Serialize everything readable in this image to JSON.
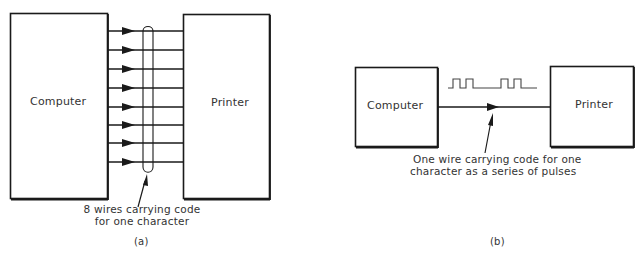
{
  "panel_a": {
    "computer_label": "Computer",
    "printer_label": "Printer",
    "wire_count": 8,
    "caption_line1": "8 wires carrying code",
    "caption_line2": "for one character",
    "panel_label": "(a)"
  },
  "panel_b": {
    "computer_label": "Computer",
    "printer_label": "Printer",
    "wire_count": 1,
    "pulse_pattern": "0101100110",
    "caption_line1": "One wire carrying code for one",
    "caption_line2": "character as a series of pulses",
    "panel_label": "(b)"
  },
  "colors": {
    "line": "#1a1a1a",
    "text": "#333333",
    "background": "#ffffff"
  }
}
